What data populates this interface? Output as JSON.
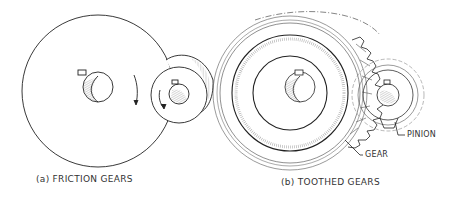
{
  "figure": {
    "panels": [
      {
        "id": "a",
        "caption": "(a) FRICTION GEARS"
      },
      {
        "id": "b",
        "caption": "(b) TOOTHED GEARS",
        "callouts": {
          "pinion": "PINION",
          "gear": "GEAR"
        }
      }
    ],
    "colors": {
      "line": "#222222",
      "hatch": "#777777",
      "background": "#ffffff"
    }
  }
}
